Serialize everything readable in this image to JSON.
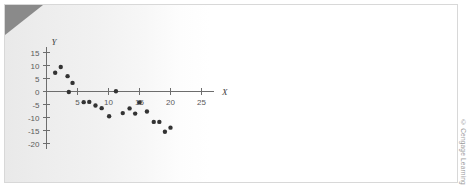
{
  "figure": {
    "attribution": "© Cengage Learning",
    "corner_fold_color": "#8a8a8a",
    "point_color": "#333333",
    "axis_color": "#6d6d6d",
    "background_color": "#ffffff"
  },
  "chart_data": {
    "type": "scatter",
    "title": "",
    "subtitle": "",
    "xlabel": "X",
    "ylabel": "Y",
    "xlim": [
      0,
      27
    ],
    "ylim": [
      -22,
      17
    ],
    "xticks": [
      5,
      10,
      15,
      20,
      25
    ],
    "yticks": [
      15,
      10,
      5,
      0,
      -5,
      -10,
      -15,
      -20
    ],
    "xticklabels": [
      "5",
      "10",
      "15",
      "20",
      "25"
    ],
    "yticklabels": [
      "15",
      "10",
      "5",
      "0",
      "-5",
      "-10",
      "-15",
      "-20"
    ],
    "grid": false,
    "legend": null,
    "series": [
      {
        "name": "observations",
        "marker": "circle",
        "color": "#333333",
        "points": [
          [
            1.4,
            7.2
          ],
          [
            2.3,
            9.4
          ],
          [
            3.4,
            5.9
          ],
          [
            4.2,
            3.3
          ],
          [
            3.6,
            -0.2
          ],
          [
            6.0,
            -4.1
          ],
          [
            6.9,
            -4.0
          ],
          [
            7.9,
            -5.4
          ],
          [
            8.9,
            -6.4
          ],
          [
            10.1,
            -9.5
          ],
          [
            11.2,
            0.1
          ],
          [
            12.3,
            -8.3
          ],
          [
            13.4,
            -6.5
          ],
          [
            14.3,
            -8.5
          ],
          [
            15.0,
            -4.2
          ],
          [
            16.2,
            -7.7
          ],
          [
            17.3,
            -11.7
          ],
          [
            18.2,
            -11.7
          ],
          [
            19.1,
            -15.5
          ],
          [
            20.0,
            -13.9
          ]
        ]
      }
    ]
  }
}
